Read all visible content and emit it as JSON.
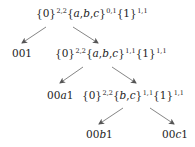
{
  "nodes": {
    "root": {
      "set0": "{0}",
      "sup0": "2,2",
      "set1_open": "{",
      "set1_a": "a",
      "set1_c1": ",",
      "set1_b": "b",
      "set1_c2": ",",
      "set1_c": "c",
      "set1_close": "}",
      "sup1": "0,1",
      "set2": "{1}",
      "sup2": "1,1"
    },
    "left1": {
      "label": "001"
    },
    "mid1": {
      "set0": "{0}",
      "sup0": "2,2",
      "set1_open": "{",
      "set1_a": "a",
      "set1_c1": ",",
      "set1_b": "b",
      "set1_c2": ",",
      "set1_c": "c",
      "set1_close": "}",
      "sup1": "1,1",
      "set2": "{1}",
      "sup2": "1,1"
    },
    "left2": {
      "prefix": "00",
      "var": "a",
      "suffix": "1"
    },
    "mid2": {
      "set0": "{0}",
      "sup0": "2,2",
      "set1_open": "{",
      "set1_b": "b",
      "set1_c1": ",",
      "set1_c": "c",
      "set1_close": "}",
      "sup1": "1,1",
      "set2": "{1}",
      "sup2": "1,1"
    },
    "leaf_b": {
      "prefix": "00",
      "var": "b",
      "suffix": "1"
    },
    "leaf_c": {
      "prefix": "00",
      "var": "c",
      "suffix": "1"
    }
  },
  "edges": [
    {
      "from": "root",
      "to": "left1"
    },
    {
      "from": "root",
      "to": "mid1"
    },
    {
      "from": "mid1",
      "to": "left2"
    },
    {
      "from": "mid1",
      "to": "mid2"
    },
    {
      "from": "mid2",
      "to": "leaf_b"
    },
    {
      "from": "mid2",
      "to": "leaf_c"
    }
  ],
  "colors": {
    "text": "#222222",
    "edge": "#555555"
  }
}
